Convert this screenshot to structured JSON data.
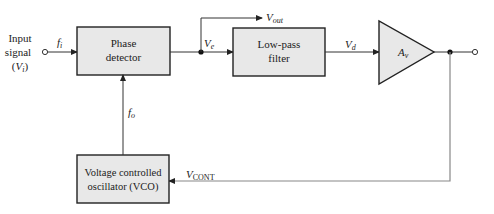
{
  "diagram": {
    "input": {
      "label_line1": "Input",
      "label_line2": "signal",
      "label_line3_prefix": "(",
      "label_line3_var": "V",
      "label_line3_sub": "i",
      "label_line3_suffix": ")",
      "freq_var": "f",
      "freq_sub": "i"
    },
    "blocks": {
      "phase_detector": {
        "line1": "Phase",
        "line2": "detector"
      },
      "low_pass_filter": {
        "line1": "Low-pass",
        "line2": "filter"
      },
      "amplifier": {
        "var": "A",
        "sub": "v"
      },
      "vco": {
        "line1": "Voltage controlled",
        "line2": "oscillator (VCO)"
      }
    },
    "signals": {
      "ve": {
        "var": "V",
        "sub": "e"
      },
      "vout": {
        "var": "V",
        "sub": "out"
      },
      "vd": {
        "var": "V",
        "sub": "d"
      },
      "fo": {
        "var": "f",
        "sub": "o"
      },
      "vcont": {
        "var": "V",
        "sub": "CONT"
      }
    },
    "colors": {
      "block_fill": "#e8e8e8",
      "line": "#333333",
      "feedback_line": "#888888"
    }
  }
}
